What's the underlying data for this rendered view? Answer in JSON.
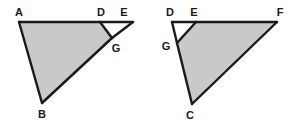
{
  "figure": {
    "background_color": "#ffffff",
    "stroke_color": "#1a1a1a",
    "shade_color": "#c9c9c9",
    "stroke_width": 2.4,
    "canvas": {
      "width": 296,
      "height": 127
    }
  },
  "diagrams": [
    {
      "id": "left",
      "name": "triangle-abe-with-shaded-quad-adgb",
      "outer_triangle": [
        "A",
        "B",
        "E"
      ],
      "shaded_region": [
        "A",
        "D",
        "G",
        "B"
      ],
      "unshaded_region": [
        "D",
        "E",
        "G"
      ],
      "points": {
        "A": {
          "x": 19,
          "y": 22,
          "label": "A",
          "label_x": 19,
          "label_y": 16
        },
        "B": {
          "x": 42,
          "y": 103,
          "label": "B",
          "label_x": 42,
          "label_y": 118
        },
        "D": {
          "x": 100,
          "y": 22,
          "label": "D",
          "label_x": 101,
          "label_y": 16
        },
        "E": {
          "x": 133,
          "y": 22,
          "label": "E",
          "label_x": 124,
          "label_y": 16
        },
        "G": {
          "x": 112,
          "y": 38,
          "label": "G",
          "label_x": 116,
          "label_y": 52
        }
      },
      "segments": [
        [
          "A",
          "D"
        ],
        [
          "D",
          "E"
        ],
        [
          "E",
          "G"
        ],
        [
          "G",
          "B"
        ],
        [
          "B",
          "A"
        ],
        [
          "D",
          "G"
        ]
      ]
    },
    {
      "id": "right",
      "name": "triangle-dcf-with-shaded-quad-gefc",
      "outer_triangle": [
        "D",
        "C",
        "F"
      ],
      "shaded_region": [
        "G",
        "E",
        "F",
        "C"
      ],
      "unshaded_region": [
        "D",
        "E",
        "G"
      ],
      "points": {
        "D": {
          "x": 172,
          "y": 22,
          "label": "D",
          "label_x": 170,
          "label_y": 16
        },
        "E": {
          "x": 196,
          "y": 22,
          "label": "E",
          "label_x": 194,
          "label_y": 16
        },
        "F": {
          "x": 277,
          "y": 22,
          "label": "F",
          "label_x": 280,
          "label_y": 16
        },
        "G": {
          "x": 177,
          "y": 43,
          "label": "G",
          "label_x": 166,
          "label_y": 50
        },
        "C": {
          "x": 192,
          "y": 104,
          "label": "C",
          "label_x": 190,
          "label_y": 119
        }
      },
      "segments": [
        [
          "D",
          "E"
        ],
        [
          "E",
          "F"
        ],
        [
          "F",
          "C"
        ],
        [
          "C",
          "G"
        ],
        [
          "G",
          "D"
        ],
        [
          "E",
          "G"
        ]
      ]
    }
  ]
}
